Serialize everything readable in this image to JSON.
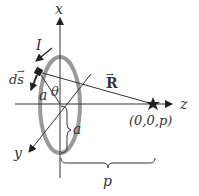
{
  "diagram": {
    "labels": {
      "x_axis": "x",
      "y_axis": "y",
      "z_axis": "z",
      "current": "I",
      "ds": "ds",
      "ds_arrow": "→",
      "radius_top": "a",
      "theta": "θ",
      "R": "R",
      "R_arrow": "→",
      "radius_brace": "a",
      "point": "(0,0,p)",
      "distance": "p"
    },
    "colors": {
      "loop": "#9a9a9a",
      "lines": "#333333",
      "background": "#ffffff"
    }
  }
}
